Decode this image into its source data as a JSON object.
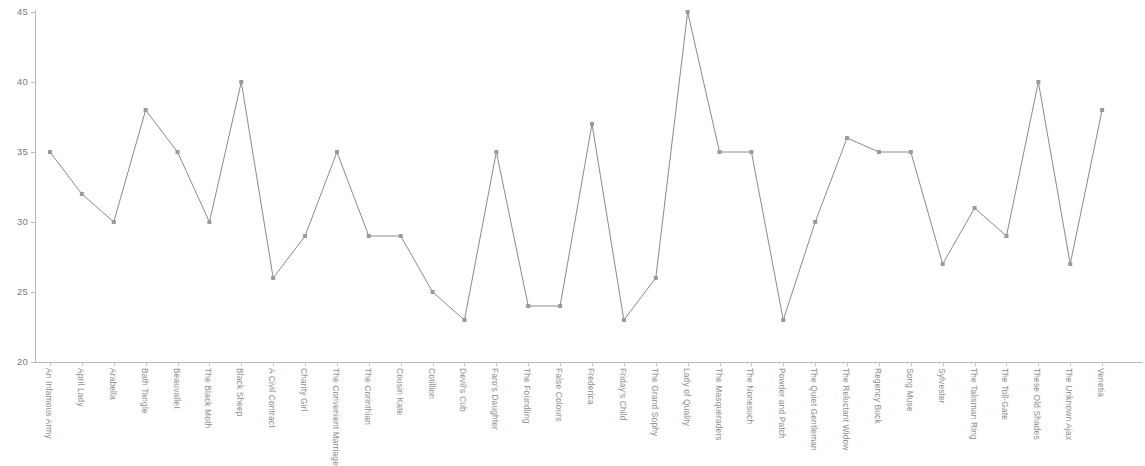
{
  "chart_data": {
    "type": "line",
    "title": "",
    "subtitle": "",
    "xlabel": "",
    "ylabel": "",
    "ylim": [
      20,
      45
    ],
    "y_ticks": [
      20,
      25,
      30,
      35,
      40,
      45
    ],
    "grid": false,
    "legend": "none",
    "marker": "square",
    "line_color": "#8a8a8a",
    "marker_color": "#9a9a9a",
    "axis_color": "#b9b9b9",
    "tick_label_color": "#7a7a7a",
    "categories": [
      "An Infamous Army",
      "April Lady",
      "Arabella",
      "Bath Tangle",
      "Beauvallet",
      "The Black Moth",
      "Black Sheep",
      "A Civil Contract",
      "Charity Girl",
      "The Convenient Marriage",
      "The Corinthian",
      "Cousin Kate",
      "Cotillion",
      "Devil's Cub",
      "Faro's Daughter",
      "The Foundling",
      "False Colours",
      "Frederica",
      "Friday's Child",
      "The Grand Sophy",
      "Lady of Quality",
      "The Masqueraders",
      "The Nonesuch",
      "Powder and Patch",
      "The Quiet Gentleman",
      "The Reluctant Widow",
      "Regency Buck",
      "Song Muse",
      "Sylvester",
      "The Talisman Ring",
      "The Toll-Gate",
      "These Old Shades",
      "The Unknown Ajax",
      "Venetia"
    ],
    "values": [
      35,
      32,
      30,
      38,
      35,
      30,
      40,
      26,
      29,
      35,
      29,
      29,
      25,
      23,
      35,
      24,
      24,
      37,
      23,
      26,
      45,
      35,
      35,
      23,
      30,
      36,
      35,
      35,
      27,
      31,
      29,
      40,
      27,
      38
    ]
  }
}
